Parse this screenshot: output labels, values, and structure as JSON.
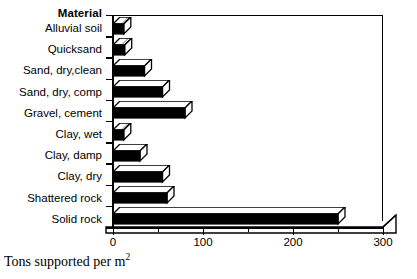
{
  "chart_data": {
    "type": "bar",
    "orientation": "horizontal",
    "title": "",
    "category_header": "Material",
    "categories": [
      "Alluvial soil",
      "Quicksand",
      "Sand, dry,clean",
      "Sand, dry, comp",
      "Gravel, cement",
      "Clay, wet",
      "Clay, damp",
      "Clay, dry",
      "Shattered rock",
      "Solid rock"
    ],
    "values": [
      12,
      13,
      35,
      55,
      80,
      12,
      30,
      55,
      60,
      250
    ],
    "xlabel": "Tons supported per m",
    "xlabel_superscript": "2",
    "ylabel": "",
    "xlim": [
      0,
      300
    ],
    "xticks": [
      0,
      100,
      200,
      300
    ],
    "xtick_labels": [
      "0",
      "100",
      "200",
      "300"
    ],
    "xticks_minor": [
      50,
      150,
      250
    ],
    "grid": false,
    "legend": false,
    "style": "3d-horizontal-bar",
    "bar_color": "#000000",
    "bar_face_color": "#ffffff",
    "plot_background": "#ffffff"
  }
}
